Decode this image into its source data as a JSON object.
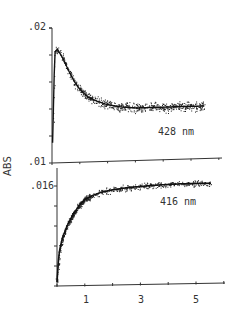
{
  "chart_data": [
    {
      "type": "scatter",
      "panel": "top",
      "annotation": "428 nm",
      "ylabel": "ABS",
      "xlabel": "",
      "ytick_labels": [
        ".02",
        ".01"
      ],
      "ylim": [
        0.01,
        0.02
      ],
      "xlim": [
        0,
        6
      ],
      "xticks": [
        0,
        1,
        2,
        3,
        4,
        5,
        6
      ],
      "grid": false,
      "fit_line": true,
      "x": [
        0.02,
        0.1,
        0.2,
        0.4,
        0.6,
        0.8,
        1.0,
        1.3,
        1.6,
        2.0,
        2.5,
        3.0,
        3.5,
        4.0,
        4.5,
        5.0,
        5.5
      ],
      "y": [
        0.0115,
        0.0182,
        0.0184,
        0.0177,
        0.0168,
        0.016,
        0.0154,
        0.0148,
        0.0145,
        0.0142,
        0.014,
        0.0139,
        0.0139,
        0.0139,
        0.0139,
        0.0139,
        0.0139
      ]
    },
    {
      "type": "scatter",
      "panel": "bottom",
      "annotation": "416 nm",
      "ylabel": "ABS",
      "xlabel": "",
      "ytick_labels": [
        ".016"
      ],
      "xtick_labels": [
        "1",
        "3",
        "5"
      ],
      "xlim": [
        0,
        6
      ],
      "xticks": [
        0,
        1,
        2,
        3,
        4,
        5,
        6
      ],
      "grid": false,
      "fit_line": true,
      "x": [
        0.0,
        0.05,
        0.1,
        0.2,
        0.4,
        0.6,
        0.8,
        1.0,
        1.3,
        1.6,
        2.0,
        2.5,
        3.0,
        3.5,
        4.0,
        4.5,
        5.0,
        5.5
      ],
      "y_pixel_fraction": [
        0.03,
        0.25,
        0.36,
        0.48,
        0.62,
        0.72,
        0.8,
        0.86,
        0.9,
        0.93,
        0.95,
        0.97,
        0.98,
        0.99,
        0.995,
        1.0,
        1.0,
        1.0
      ],
      "y_plateau": 0.016
    }
  ],
  "labels": {
    "top_ymax": ".02",
    "top_ymin": ".01",
    "bottom_ytick": ".016",
    "ylabel": "ABS",
    "top_annotation": "428 nm",
    "bottom_annotation": "416 nm",
    "x1": "1",
    "x3": "3",
    "x5": "5"
  }
}
